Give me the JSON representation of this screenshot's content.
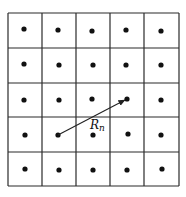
{
  "diagram": {
    "type": "lattice-grid",
    "rows": 5,
    "cols": 5,
    "grid": {
      "x_lines": [
        8,
        42,
        76,
        110,
        144,
        179
      ],
      "y_lines": [
        13,
        48,
        83,
        117,
        152,
        186
      ],
      "stroke": "#2a2a2a",
      "stroke_width": 1.2
    },
    "dots": {
      "radius": 2.6,
      "color": "#111111",
      "positions": [
        [
          24,
          29
        ],
        [
          58,
          30
        ],
        [
          92,
          31
        ],
        [
          126,
          30
        ],
        [
          161,
          31
        ],
        [
          24,
          64
        ],
        [
          59,
          65
        ],
        [
          93,
          65
        ],
        [
          126,
          65
        ],
        [
          161,
          65
        ],
        [
          24,
          100
        ],
        [
          59,
          100
        ],
        [
          92,
          99
        ],
        [
          127,
          99
        ],
        [
          161,
          100
        ],
        [
          25,
          135
        ],
        [
          58,
          135
        ],
        [
          93,
          135
        ],
        [
          128,
          134
        ],
        [
          161,
          135
        ],
        [
          25,
          169
        ],
        [
          59,
          170
        ],
        [
          93,
          170
        ],
        [
          127,
          170
        ],
        [
          162,
          169
        ]
      ]
    },
    "vector": {
      "from": [
        58,
        135
      ],
      "to": [
        125,
        100
      ],
      "color": "#222222",
      "label": {
        "main": "R",
        "subscript": "n",
        "x": 90,
        "y": 129
      }
    }
  }
}
